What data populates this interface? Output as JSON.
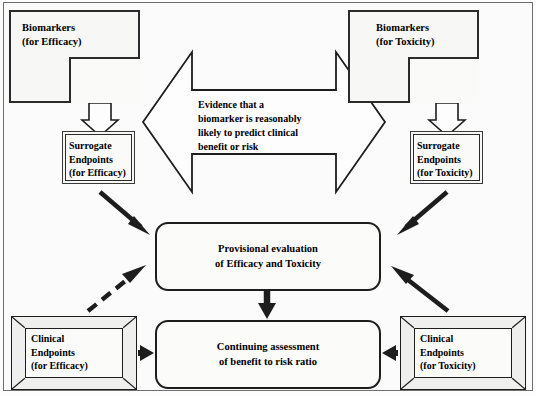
{
  "figure": {
    "colors": {
      "stroke": "#1d1d1d",
      "fill": "#fbfbf9",
      "background": "#fdfdfd",
      "frame": "#6f6f6f"
    }
  },
  "nodes": {
    "biomarker_efficacy": {
      "label": "Biomarkers\n(for Efficacy)",
      "shape": "nested-rectangle"
    },
    "biomarker_toxicity": {
      "label": "Biomarkers\n(for Toxicity)",
      "shape": "nested-rectangle"
    },
    "surrogate_efficacy": {
      "label": "Surrogate\nEndpoints\n(for Efficacy)",
      "shape": "double-border-rectangle"
    },
    "surrogate_toxicity": {
      "label": "Surrogate\nEndpoints\n(for Toxicity)",
      "shape": "double-border-rectangle"
    },
    "evidence": {
      "label": "Evidence that a\nbiomarker is reasonably\nlikely to predict clinical\nbenefit or risk",
      "shape": "bidirectional-block-arrow"
    },
    "provisional_evaluation": {
      "label": "Provisional evaluation\nof Efficacy and Toxicity",
      "shape": "rounded-rectangle"
    },
    "continuing_assessment": {
      "label": "Continuing assessment\nof benefit to risk ratio",
      "shape": "rounded-rectangle"
    },
    "clinical_efficacy": {
      "label": "Clinical\nEndpoints\n(for Efficacy)",
      "shape": "bevelled-frame-rectangle"
    },
    "clinical_toxicity": {
      "label": "Clinical\nEndpoints\n(for Toxicity)",
      "shape": "bevelled-frame-rectangle"
    }
  },
  "connectors": [
    {
      "name": "biomarker-efficacy-to-surrogate-efficacy",
      "style": "hollow-block-arrow",
      "direction": "down"
    },
    {
      "name": "biomarker-toxicity-to-surrogate-toxicity",
      "style": "hollow-block-arrow",
      "direction": "down"
    },
    {
      "name": "surrogate-efficacy-to-provisional",
      "style": "solid-thick-arrow",
      "direction": "down-right"
    },
    {
      "name": "surrogate-toxicity-to-provisional",
      "style": "solid-thick-arrow",
      "direction": "down-left"
    },
    {
      "name": "clinical-efficacy-to-provisional",
      "style": "dashed-thick-arrow",
      "direction": "up-right"
    },
    {
      "name": "clinical-toxicity-to-provisional",
      "style": "solid-thick-arrow",
      "direction": "up-left"
    },
    {
      "name": "provisional-to-continuing",
      "style": "solid-thick-arrow",
      "direction": "down"
    },
    {
      "name": "clinical-efficacy-to-continuing",
      "style": "solid-thick-arrow",
      "direction": "right"
    },
    {
      "name": "clinical-toxicity-to-continuing",
      "style": "solid-thick-arrow",
      "direction": "left"
    }
  ]
}
